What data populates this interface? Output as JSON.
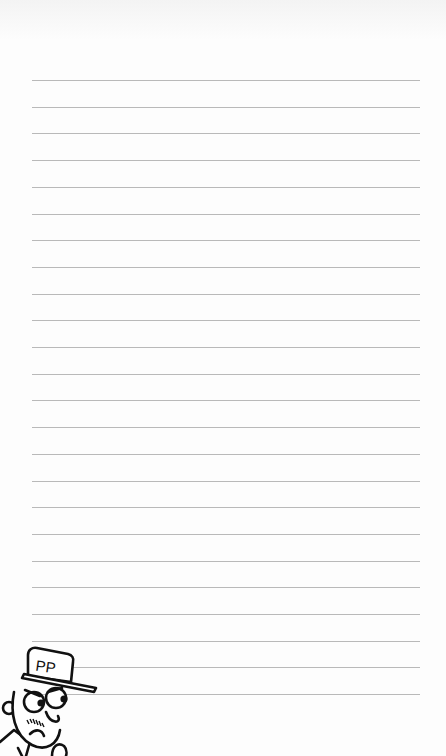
{
  "page": {
    "type": "lined-notepaper",
    "background": "#fdfdfd",
    "line_color": "#b9b9b9"
  },
  "lines": {
    "count": 24,
    "start_y": 80,
    "spacing": 26.7,
    "left": 32,
    "right": 420
  },
  "character": {
    "cap_text": "PP",
    "ink_color": "#111111"
  }
}
